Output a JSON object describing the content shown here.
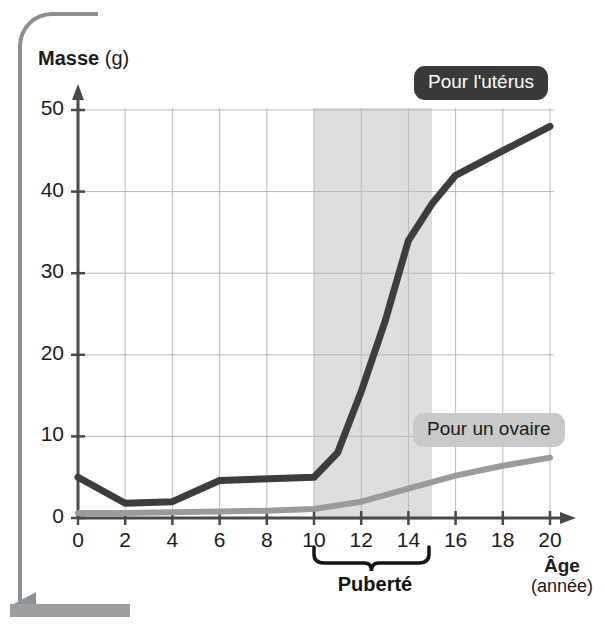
{
  "chart_data": {
    "type": "line",
    "title": "",
    "xlabel": "Âge",
    "xunit": "(année)",
    "ylabel": "Masse",
    "yunit": "(g)",
    "xlim": [
      0,
      20
    ],
    "ylim": [
      0,
      52
    ],
    "xticks": [
      0,
      2,
      4,
      6,
      8,
      10,
      12,
      14,
      16,
      18,
      20
    ],
    "yticks": [
      0,
      10,
      20,
      30,
      40,
      50
    ],
    "grid": true,
    "legend_position": "inside-right",
    "annotations": [
      {
        "name": "puberty-band",
        "label": "Puberté",
        "x_start": 10,
        "x_end": 15,
        "shading_color": "#d8d8d8"
      }
    ],
    "series": [
      {
        "name": "Pour l'utérus",
        "color": "#3d3d3d",
        "x": [
          0,
          2,
          4,
          6,
          10,
          11,
          12,
          13,
          14,
          15,
          16,
          20
        ],
        "values": [
          5,
          1.8,
          2,
          4.6,
          5,
          8,
          15.5,
          24,
          34,
          38.5,
          42,
          48
        ]
      },
      {
        "name": "Pour un ovaire",
        "color": "#9b9b9b",
        "x": [
          0,
          2,
          4,
          6,
          8,
          10,
          12,
          14,
          16,
          18,
          20
        ],
        "values": [
          0.6,
          0.6,
          0.7,
          0.8,
          0.9,
          1.1,
          2.0,
          3.6,
          5.2,
          6.4,
          7.4
        ]
      }
    ]
  },
  "legend": {
    "uterus_label": "Pour l'utérus",
    "ovary_label": "Pour un ovaire"
  },
  "axes": {
    "y_title_bold": "Masse",
    "y_title_unit": "(g)",
    "x_title_bold": "Âge",
    "x_title_unit": "(année)"
  },
  "colors": {
    "uterus_line": "#3d3d3d",
    "ovary_line": "#9b9b9b",
    "puberty_shade": "#d8d8d8",
    "grid": "#b9b9b9",
    "axis": "#4a4a4a",
    "badge_dark_bg": "#3a3a3a",
    "badge_light_bg": "#c9c9c9",
    "frame": "#8b8f92"
  }
}
